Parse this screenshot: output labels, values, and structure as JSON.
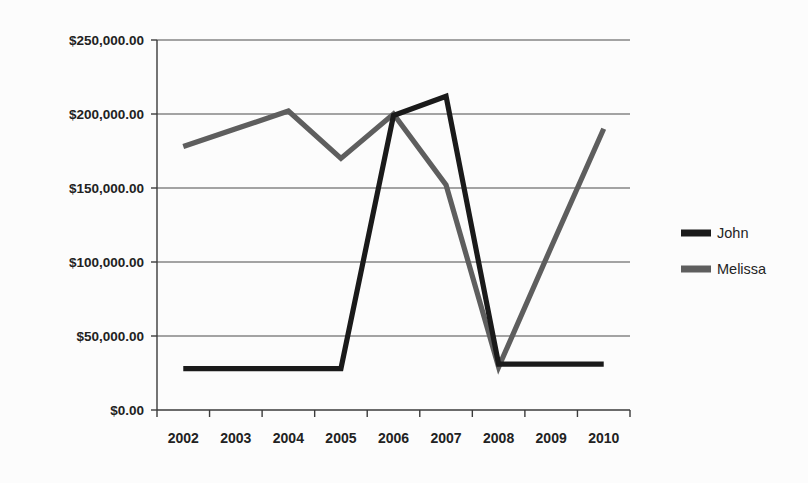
{
  "chart_data": {
    "type": "line",
    "title": "",
    "subtitle": "",
    "xlabel": "",
    "ylabel": "",
    "categories": [
      "2002",
      "2003",
      "2004",
      "2005",
      "2006",
      "2007",
      "2008",
      "2009",
      "2010"
    ],
    "series": [
      {
        "name": "John",
        "color": "#1a1a1a",
        "values": [
          28000,
          28000,
          28000,
          28000,
          199000,
          212000,
          31000,
          31000,
          31000
        ]
      },
      {
        "name": "Melissa",
        "color": "#5e5e5e",
        "values": [
          178000,
          190000,
          202000,
          170000,
          200000,
          152000,
          29000,
          110000,
          190000
        ]
      }
    ],
    "ylim": [
      0,
      250000
    ],
    "ytick_values": [
      0,
      50000,
      100000,
      150000,
      200000,
      250000
    ],
    "ytick_labels": [
      "$0.00",
      "$50,000.00",
      "$100,000.00",
      "$150,000.00",
      "$200,000.00",
      "$250,000.00"
    ],
    "grid": "horizontal",
    "legend_position": "right",
    "background_color": "#fcfcfc",
    "axis_color": "#3b3b3b",
    "grid_color": "#4a4a4a"
  },
  "legend": {
    "entries": [
      {
        "label": "John",
        "color": "#1a1a1a"
      },
      {
        "label": "Melissa",
        "color": "#5e5e5e"
      }
    ]
  }
}
